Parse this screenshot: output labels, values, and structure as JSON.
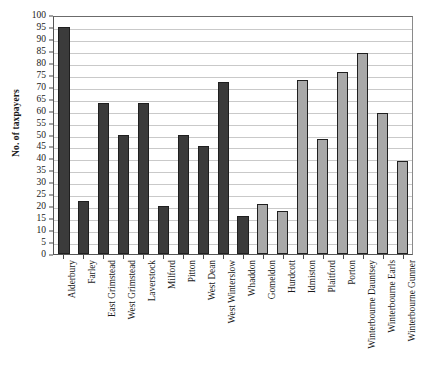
{
  "chart_data": {
    "type": "bar",
    "title": "",
    "xlabel": "",
    "ylabel": "No. of taxpayers",
    "ylim": [
      0,
      100
    ],
    "ytick_step": 5,
    "gridlines": true,
    "grid_step": 5,
    "legend": "none",
    "ytick_labels": [
      "100",
      "95",
      "90",
      "85",
      "80",
      "75",
      "70",
      "65",
      "60",
      "55",
      "50",
      "45",
      "40",
      "35",
      "30",
      "25",
      "20",
      "15",
      "10",
      "5",
      "0"
    ],
    "categories": [
      "Alderbury",
      "Farley",
      "East Grimstead",
      "West Grimstead",
      "Laverstock",
      "Milford",
      "Pitton",
      "West Dean",
      "West Winterslow",
      "Whaddon",
      "Gomeldon",
      "Hurdcott",
      "Idmiston",
      "Plaitford",
      "Porton",
      "Winterbourne Dauntsey",
      "Winterbourne Earls",
      "Winterbourne Gunner"
    ],
    "values": [
      95,
      22,
      63,
      50,
      63,
      20,
      50,
      45,
      72,
      16,
      21,
      18,
      73,
      48,
      76,
      84,
      59,
      39
    ],
    "bar_groups": [
      "dark",
      "dark",
      "dark",
      "dark",
      "dark",
      "dark",
      "dark",
      "dark",
      "dark",
      "dark",
      "grey",
      "grey",
      "grey",
      "grey",
      "grey",
      "grey",
      "grey",
      "grey"
    ],
    "colors": {
      "dark_bar": "#3b3b3b",
      "grey_bar": "#a9a9a9",
      "bar_border": "#1f1f1f",
      "gridline": "#c9c9c9",
      "axis": "#555555",
      "text": "#1a1a1a"
    }
  }
}
